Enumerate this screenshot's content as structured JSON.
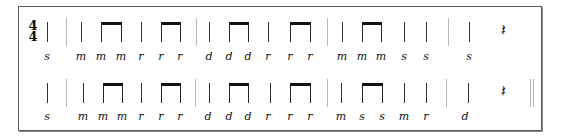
{
  "time_signature": {
    "top": "4",
    "bottom": "4"
  },
  "rest_glyph": "𝄽",
  "rows": [
    {
      "stem_top": 22,
      "stem_bottom": 42,
      "syl_top": 51,
      "quarters": [
        47,
        81,
        141,
        209,
        268,
        342,
        404,
        426,
        469
      ],
      "beams": [
        [
          101,
          121
        ],
        [
          161,
          180
        ],
        [
          229,
          248
        ],
        [
          290,
          310
        ],
        [
          362,
          381
        ]
      ],
      "barlines": [
        66,
        196,
        327,
        448
      ],
      "rest_x": 503,
      "double_bar": null,
      "syllables": [
        {
          "x": 47,
          "t": "s"
        },
        {
          "x": 81,
          "t": "m"
        },
        {
          "x": 101,
          "t": "m"
        },
        {
          "x": 121,
          "t": "m"
        },
        {
          "x": 141,
          "t": "r"
        },
        {
          "x": 161,
          "t": "r"
        },
        {
          "x": 180,
          "t": "r"
        },
        {
          "x": 209,
          "t": "d"
        },
        {
          "x": 229,
          "t": "d"
        },
        {
          "x": 248,
          "t": "d"
        },
        {
          "x": 268,
          "t": "r"
        },
        {
          "x": 290,
          "t": "r"
        },
        {
          "x": 310,
          "t": "r"
        },
        {
          "x": 342,
          "t": "m"
        },
        {
          "x": 362,
          "t": "m"
        },
        {
          "x": 381,
          "t": "m"
        },
        {
          "x": 404,
          "t": "s"
        },
        {
          "x": 426,
          "t": "s"
        },
        {
          "x": 469,
          "t": "s"
        }
      ]
    },
    {
      "stem_top": 83,
      "stem_bottom": 103,
      "syl_top": 111,
      "quarters": [
        47,
        83,
        149,
        209,
        270,
        341,
        404,
        426,
        468
      ],
      "beams": [
        [
          103,
          122
        ],
        [
          161,
          180
        ],
        [
          229,
          248
        ],
        [
          290,
          310
        ],
        [
          362,
          382
        ]
      ],
      "barlines": [
        66,
        195,
        327,
        446
      ],
      "rest_x": 503,
      "double_bar": 530,
      "syllables": [
        {
          "x": 47,
          "t": "s"
        },
        {
          "x": 83,
          "t": "m"
        },
        {
          "x": 103,
          "t": "m"
        },
        {
          "x": 122,
          "t": "m"
        },
        {
          "x": 141,
          "t": "r"
        },
        {
          "x": 161,
          "t": "r"
        },
        {
          "x": 180,
          "t": "r"
        },
        {
          "x": 208,
          "t": "d"
        },
        {
          "x": 229,
          "t": "d"
        },
        {
          "x": 248,
          "t": "d"
        },
        {
          "x": 268,
          "t": "r"
        },
        {
          "x": 290,
          "t": "r"
        },
        {
          "x": 310,
          "t": "r"
        },
        {
          "x": 341,
          "t": "m"
        },
        {
          "x": 362,
          "t": "s"
        },
        {
          "x": 382,
          "t": "s"
        },
        {
          "x": 404,
          "t": "m"
        },
        {
          "x": 426,
          "t": "r"
        },
        {
          "x": 465,
          "t": "d"
        }
      ]
    }
  ]
}
